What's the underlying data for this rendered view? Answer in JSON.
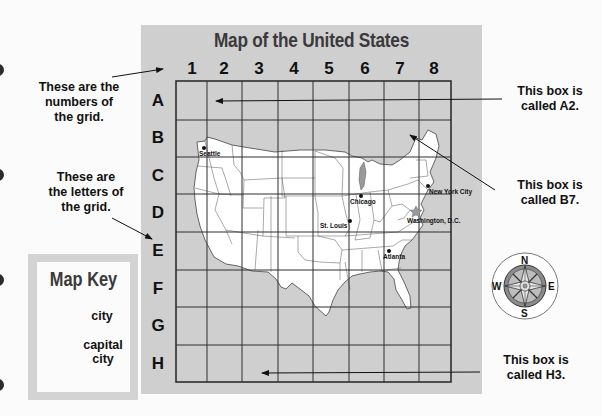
{
  "title": "Map of the United States",
  "grid": {
    "columns": [
      "1",
      "2",
      "3",
      "4",
      "5",
      "6",
      "7",
      "8"
    ],
    "rows": [
      "A",
      "B",
      "C",
      "D",
      "E",
      "F",
      "G",
      "H"
    ]
  },
  "annotations": {
    "numbers_note": [
      "These are the",
      "numbers of",
      "the grid."
    ],
    "letters_note": [
      "These are",
      "the letters of",
      "the grid."
    ],
    "a2_note": [
      "This box is",
      "called A2."
    ],
    "b7_note": [
      "This box is",
      "called B7."
    ],
    "h3_note": [
      "This box is",
      "called H3."
    ]
  },
  "cities": [
    {
      "name": "Seattle",
      "type": "city",
      "cell": "B1"
    },
    {
      "name": "Chicago",
      "type": "city",
      "cell": "D6"
    },
    {
      "name": "St. Louis",
      "type": "city",
      "cell": "D5"
    },
    {
      "name": "New York City",
      "type": "city",
      "cell": "C8"
    },
    {
      "name": "Washington, D.C.",
      "type": "capital",
      "cell": "D7"
    },
    {
      "name": "Atlanta",
      "type": "city",
      "cell": "E7"
    }
  ],
  "map_key": {
    "title": "Map Key",
    "items": [
      {
        "symbol": "dot",
        "label": "city"
      },
      {
        "symbol": "star",
        "label_line1": "capital",
        "label_line2": "city"
      }
    ]
  },
  "compass": {
    "n": "N",
    "e": "E",
    "s": "S",
    "w": "W"
  },
  "colors": {
    "panel": "#cfcfcf",
    "page": "#fbfbfb",
    "grid_line": "#2e2e2e",
    "land": "#ffffff",
    "title": "#3a3a3a"
  }
}
